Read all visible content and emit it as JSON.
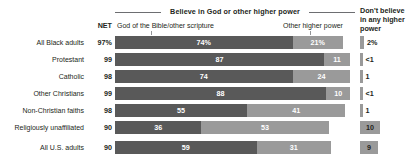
{
  "header": {
    "bracket_title": "Believe in God or other higher power",
    "net_label": "NET",
    "segment_labels": {
      "dark": "God of the Bible/other scripture",
      "light": "Other higher power"
    },
    "right_column_title": "Don't believe in any higher power"
  },
  "colors": {
    "dark_segment": "#595959",
    "light_segment": "#9a9a9a",
    "text": "#231f20",
    "rule": "#6d6e71",
    "background": "#ffffff"
  },
  "chart_data": {
    "type": "bar",
    "title": "Believe in God or other higher power",
    "xlabel": "",
    "ylabel": "",
    "xlim": [
      0,
      100
    ],
    "grid": false,
    "legend_position": "top",
    "stacked": true,
    "categories": [
      "All Black adults",
      "Protestant",
      "Catholic",
      "Other Christians",
      "Non-Christian faiths",
      "Religiously unaffiliated",
      "All U.S. adults"
    ],
    "series": [
      {
        "name": "God of the Bible/other scripture",
        "values": [
          74,
          87,
          74,
          88,
          55,
          36,
          59
        ],
        "labels": [
          "74%",
          "87",
          "74",
          "88",
          "55",
          "36",
          "59"
        ]
      },
      {
        "name": "Other higher power",
        "values": [
          21,
          11,
          24,
          10,
          41,
          53,
          31
        ],
        "labels": [
          "21%",
          "11",
          "24",
          "10",
          "41",
          "53",
          "31"
        ]
      },
      {
        "name": "Don't believe in any higher power",
        "values": [
          2,
          0.5,
          1,
          0.5,
          1,
          10,
          9
        ],
        "labels": [
          "2%",
          "<1",
          "1",
          "<1",
          "1",
          "10",
          "9"
        ]
      }
    ],
    "net": {
      "name": "NET",
      "labels": [
        "97%",
        "99",
        "98",
        "99",
        "98",
        "90",
        "90"
      ],
      "values": [
        97,
        99,
        98,
        99,
        98,
        90,
        90
      ]
    }
  },
  "rows": [
    {
      "label": "All Black adults",
      "indent": 0,
      "net": "97%",
      "dark": 74,
      "dark_label": "74%",
      "light": 21,
      "light_label": "21%",
      "right": "2%",
      "right_bar": 2
    },
    {
      "label": "Protestant",
      "indent": 1,
      "net": "99",
      "dark": 87,
      "dark_label": "87",
      "light": 11,
      "light_label": "11",
      "right": "<1",
      "right_bar": 0.5
    },
    {
      "label": "Catholic",
      "indent": 1,
      "net": "98",
      "dark": 74,
      "dark_label": "74",
      "light": 24,
      "light_label": "24",
      "right": "1",
      "right_bar": 1
    },
    {
      "label": "Other Christians",
      "indent": 1,
      "net": "99",
      "dark": 88,
      "dark_label": "88",
      "light": 10,
      "light_label": "10",
      "right": "<1",
      "right_bar": 0.5
    },
    {
      "label": "Non-Christian faiths",
      "indent": 1,
      "net": "98",
      "dark": 55,
      "dark_label": "55",
      "light": 41,
      "light_label": "41",
      "right": "1",
      "right_bar": 1
    },
    {
      "label": "Religiously unaffiliated",
      "indent": 1,
      "net": "90",
      "dark": 36,
      "dark_label": "36",
      "light": 53,
      "light_label": "53",
      "right": "10",
      "right_bar": 10
    },
    {
      "label": "All U.S. adults",
      "indent": 0,
      "net": "90",
      "dark": 59,
      "dark_label": "59",
      "light": 31,
      "light_label": "31",
      "right": "9",
      "right_bar": 9
    }
  ]
}
